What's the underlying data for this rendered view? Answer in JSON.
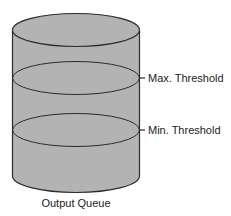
{
  "diagram": {
    "type": "cylinder-queue",
    "title": "Output Queue",
    "colors": {
      "fill": "#b3b3b3",
      "stroke": "#2b2b2b",
      "text": "#222222"
    },
    "thresholds": [
      {
        "label": "Max. Threshold",
        "level": "upper"
      },
      {
        "label": "Min. Threshold",
        "level": "lower"
      }
    ]
  }
}
